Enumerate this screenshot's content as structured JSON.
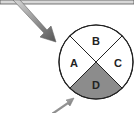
{
  "diagram": {
    "type": "quadrant-circle",
    "quadrants": [
      {
        "id": "A",
        "label": "A",
        "position": "left",
        "shaded": false
      },
      {
        "id": "B",
        "label": "B",
        "position": "top",
        "shaded": false
      },
      {
        "id": "C",
        "label": "C",
        "position": "right",
        "shaded": false
      },
      {
        "id": "D",
        "label": "D",
        "position": "bottom",
        "shaded": true
      }
    ],
    "colors": {
      "shaded_fill": "#8c8c8c",
      "unshaded_fill": "#ffffff",
      "stroke": "#222222",
      "top_bar": "#d8d8d8",
      "arrow_fill": "#9a9a9a"
    },
    "arrows": [
      {
        "name": "large-arrow",
        "points_to": "circle upper-left edge"
      },
      {
        "name": "small-arrow",
        "points_to": "quadrant D lower-left edge"
      }
    ]
  }
}
